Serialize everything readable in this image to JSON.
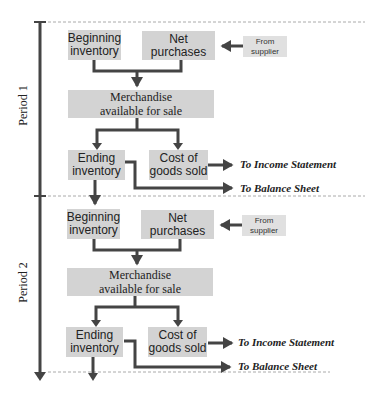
{
  "periods": [
    {
      "label": "Period 1",
      "boxes": {
        "beginning_inventory": "Beginning\ninventory",
        "net_purchases": "Net\npurchases",
        "from_supplier": "From\nsupplier",
        "merchandise": "Merchandise\navailable for sale",
        "ending_inventory": "Ending\ninventory",
        "cogs": "Cost of\ngoods sold"
      },
      "destinations": {
        "income_statement": "To Income Statement",
        "balance_sheet": "To Balance Sheet"
      }
    },
    {
      "label": "Period 2",
      "boxes": {
        "beginning_inventory": "Beginning\ninventory",
        "net_purchases": "Net\npurchases",
        "from_supplier": "From\nsupplier",
        "merchandise": "Merchandise\navailable for sale",
        "ending_inventory": "Ending\ninventory",
        "cogs": "Cost of\ngoods sold"
      },
      "destinations": {
        "income_statement": "To Income Statement",
        "balance_sheet": "To Balance Sheet"
      }
    }
  ],
  "colors": {
    "box_fill": "#d3d3d3",
    "arrow": "#444444",
    "dashed_line": "#aaaaaa"
  }
}
